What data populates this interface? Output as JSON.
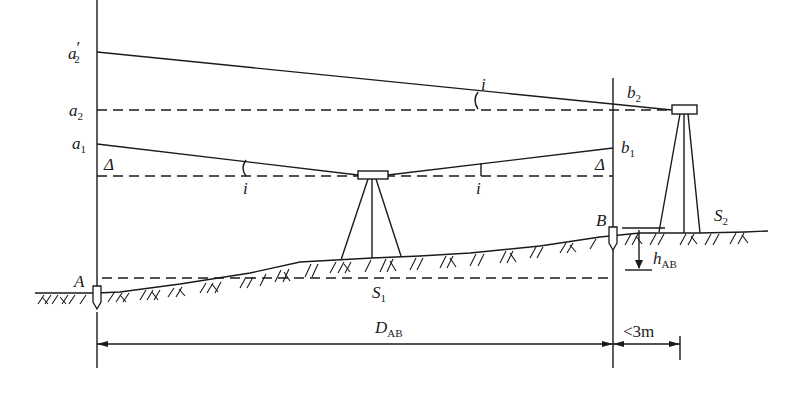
{
  "diagram": {
    "labels": {
      "a2_prime": {
        "main": "a",
        "sub": "2",
        "prime": "′"
      },
      "a2": {
        "main": "a",
        "sub": "2"
      },
      "a1": {
        "main": "a",
        "sub": "1"
      },
      "b2": {
        "main": "b",
        "sub": "2"
      },
      "b1": {
        "main": "b",
        "sub": "1"
      },
      "delta_left": "Δ",
      "delta_right": "Δ",
      "i_top": "i",
      "i_left": "i",
      "i_right": "i",
      "point_A": "A",
      "point_B": "B",
      "station_S1": {
        "main": "S",
        "sub": "1"
      },
      "station_S2": {
        "main": "S",
        "sub": "2"
      },
      "h_AB": {
        "main": "h",
        "sub": "AB"
      },
      "D_AB": {
        "main": "D",
        "sub": "AB"
      },
      "near_distance": "<3m"
    },
    "colors": {
      "ink": "#1a1a1a",
      "background": "#ffffff"
    }
  }
}
